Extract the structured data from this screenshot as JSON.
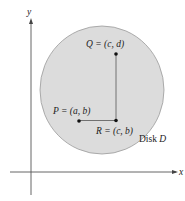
{
  "figure": {
    "axes": {
      "x_label": "x",
      "y_label": "y"
    },
    "region": {
      "label": "Disk",
      "symbol": "D",
      "fill": "#d9d9d9",
      "stroke": "#aaaaaa"
    },
    "points": {
      "P": {
        "name": "P",
        "coords": "(a, b)",
        "text": "P = (a, b)"
      },
      "Q": {
        "name": "Q",
        "coords": "(c, d)",
        "text": "Q = (c, d)"
      },
      "R": {
        "name": "R",
        "coords": "(c, b)",
        "text": "R = (c, b)"
      }
    },
    "segments": [
      {
        "from": "P",
        "to": "R",
        "orientation": "horizontal"
      },
      {
        "from": "R",
        "to": "Q",
        "orientation": "vertical"
      }
    ]
  }
}
